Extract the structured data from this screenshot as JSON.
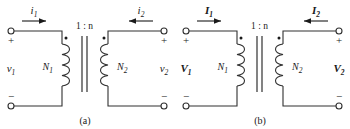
{
  "figure": {
    "background_color": "#ffffff",
    "line_color": "#303030",
    "text_color": "#1a1a1a"
  },
  "panels": [
    {
      "id": "a",
      "caption": "(a)",
      "domain": "time-domain",
      "turns_ratio": "1 : n",
      "current_left": "i",
      "current_left_sub": "1",
      "current_right": "i",
      "current_right_sub": "2",
      "voltage_left": "v",
      "voltage_left_sub": "1",
      "voltage_right": "v",
      "voltage_right_sub": "2",
      "winding_left": "N",
      "winding_left_sub": "1",
      "winding_right": "N",
      "winding_right_sub": "2",
      "polarity_top_left": "+",
      "polarity_bottom_left": "−",
      "polarity_top_right": "+",
      "polarity_bottom_right": "−",
      "left_current_direction": "right",
      "right_current_direction": "left"
    },
    {
      "id": "b",
      "caption": "(b)",
      "domain": "phasor-domain",
      "turns_ratio": "1 : n",
      "current_left": "I",
      "current_left_sub": "1",
      "current_right": "I",
      "current_right_sub": "2",
      "voltage_left": "V",
      "voltage_left_sub": "1",
      "voltage_right": "V",
      "voltage_right_sub": "2",
      "winding_left": "N",
      "winding_left_sub": "1",
      "winding_right": "N",
      "winding_right_sub": "2",
      "polarity_top_left": "+",
      "polarity_bottom_left": "−",
      "polarity_top_right": "+",
      "polarity_bottom_right": "−",
      "left_current_direction": "right",
      "right_current_direction": "left"
    }
  ]
}
